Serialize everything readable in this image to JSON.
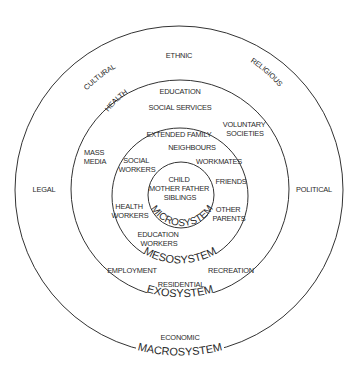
{
  "diagram": {
    "rings": [
      {
        "id": "microsystem",
        "label": "MICROSYSTEM",
        "cx": 181,
        "cy": 195,
        "r": 33
      },
      {
        "id": "mesosystem",
        "label": "MESOSYSTEM",
        "cx": 180,
        "cy": 196,
        "r": 68
      },
      {
        "id": "exosystem",
        "label": "EXOSYSTEM",
        "cx": 180,
        "cy": 189,
        "r": 109
      },
      {
        "id": "macrosystem",
        "label": "MACROSYSTEM",
        "cx": 179,
        "cy": 190,
        "r": 164
      }
    ],
    "microsystem": {
      "center_lines": [
        "CHILD",
        "MOTHER FATHER",
        "SIBLINGS"
      ]
    },
    "mesosystem": {
      "items": {
        "extended_family": "EXTENDED FAMILY",
        "neighbours": "NEIGHBOURS",
        "social_workers": [
          "SOCIAL",
          "WORKERS"
        ],
        "workmates": "WORKMATES",
        "friends": "FRIENDS",
        "health_workers": [
          "HEALTH",
          "WORKERS"
        ],
        "other_parents": [
          "OTHER",
          "PARENTS"
        ],
        "education_workers": [
          "EDUCATION",
          "WORKERS"
        ]
      }
    },
    "exosystem": {
      "items": {
        "health": "HEALTH",
        "education": "EDUCATION",
        "social_services": "SOCIAL SERVICES",
        "voluntary_societies": [
          "VOLUNTARY",
          "SOCIETIES"
        ],
        "mass_media": [
          "MASS",
          "MEDIA"
        ],
        "employment": "EMPLOYMENT",
        "recreation": "RECREATION",
        "residential": "RESIDENTIAL"
      }
    },
    "macrosystem": {
      "items": {
        "cultural": "CULTURAL",
        "ethnic": "ETHNIC",
        "religious": "RELIGIOUS",
        "legal": "LEGAL",
        "political": "POLITICAL",
        "economic": "ECONOMIC"
      }
    },
    "colors": {
      "line": "#333333",
      "text": "#2a2a2a",
      "background": "#ffffff"
    }
  }
}
